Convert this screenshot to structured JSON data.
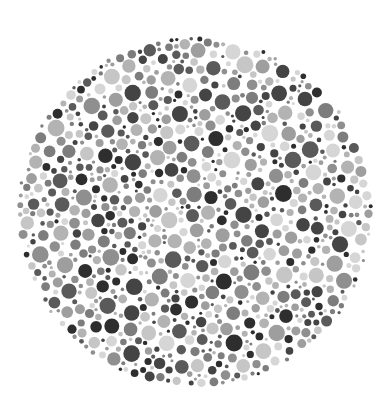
{
  "image": {
    "description": "Grayscale dot-pattern test plate (Ishihara-style)",
    "background": "#ffffff",
    "plate": {
      "cx": 195,
      "cy": 212,
      "rx": 178,
      "ry": 176
    },
    "dot_palette": [
      "#2e2e2e",
      "#444444",
      "#5a5a5a",
      "#7d7d7d",
      "#8f8f8f",
      "#9e9e9e",
      "#b3b3b3",
      "#c6c6c6",
      "#d6d6d6"
    ],
    "dot_radius_range": [
      1.5,
      8.5
    ],
    "seed": 1337
  }
}
